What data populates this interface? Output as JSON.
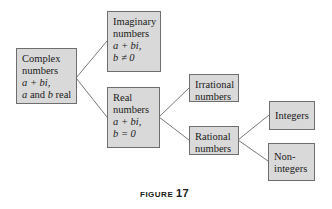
{
  "diagram": {
    "nodes": {
      "complex": {
        "lines": [
          "Complex",
          "numbers",
          "a + bi,",
          "a and b real"
        ]
      },
      "imaginary": {
        "lines": [
          "Imaginary",
          "numbers",
          "a + bi,",
          "b ≠ 0"
        ]
      },
      "real": {
        "lines": [
          "Real",
          "numbers",
          "a + bi,",
          "b = 0"
        ]
      },
      "irrational": {
        "lines": [
          "Irrational",
          "numbers"
        ]
      },
      "rational": {
        "lines": [
          "Rational",
          "numbers"
        ]
      },
      "integers": {
        "lines": [
          "Integers"
        ]
      },
      "nonintegers": {
        "lines": [
          "Non-",
          "integers"
        ]
      }
    },
    "edges": [
      [
        "complex",
        "imaginary"
      ],
      [
        "complex",
        "real"
      ],
      [
        "real",
        "irrational"
      ],
      [
        "real",
        "rational"
      ],
      [
        "rational",
        "integers"
      ],
      [
        "rational",
        "nonintegers"
      ]
    ],
    "colors": {
      "box_fill": "#d9d9d9",
      "box_border": "#6e6e6e",
      "line": "#555555"
    }
  },
  "caption": {
    "label": "FIGURE",
    "number": "17"
  }
}
